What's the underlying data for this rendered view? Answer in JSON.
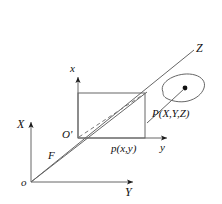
{
  "figure": {
    "name": "perspective-projection-diagram",
    "caption": "",
    "background_color": "#ffffff",
    "line_color": "#555555",
    "text_color": "#111111"
  },
  "labels": {
    "world_x_axis": "X",
    "world_y_axis": "Y",
    "world_z_axis": "Z",
    "image_x_axis": "x",
    "image_y_axis": "y",
    "camera_center": "o",
    "image_origin": "O'",
    "focal_length": "F",
    "image_point": "p(x,y)",
    "world_point": "P(X,Y,Z)"
  },
  "geometry": {
    "camera_center": {
      "x": 31,
      "y": 182
    },
    "image_origin": {
      "x": 78,
      "y": 138
    },
    "image_point": {
      "x": 145,
      "y": 138
    },
    "image_plane_rect": {
      "left": 78,
      "top": 93,
      "right": 145,
      "bottom": 138
    },
    "world_point_dot": {
      "x": 185,
      "y": 89
    },
    "world_x_axis_tip": {
      "x": 31,
      "y": 118
    },
    "world_y_axis_tip": {
      "x": 137,
      "y": 182
    },
    "world_z_axis_tip": {
      "x": 196,
      "y": 48
    },
    "image_x_axis_tip": {
      "x": 78,
      "y": 73
    },
    "image_y_axis_tip": {
      "x": 171,
      "y": 138
    },
    "blob_center": {
      "x": 184,
      "y": 90
    }
  }
}
